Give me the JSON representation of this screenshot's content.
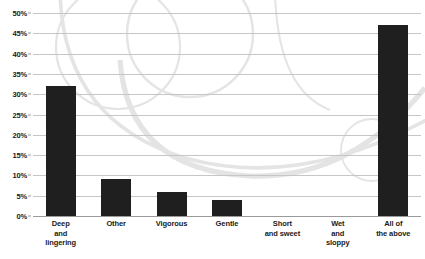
{
  "chart_data": {
    "type": "bar",
    "title": "",
    "xlabel": "",
    "ylabel": "",
    "ylim": [
      0,
      50
    ],
    "grid": true,
    "legend": false,
    "categories": [
      "Deep\nand\nlingering",
      "Other",
      "Vigorous",
      "Gentle",
      "Short\nand sweet",
      "Wet\nand\nsloppy",
      "All of\nthe above"
    ],
    "values": [
      32,
      9,
      6,
      4,
      0,
      0,
      47
    ],
    "ytick_labels": [
      "50%",
      "45%",
      "40%",
      "35%",
      "30%",
      "25%",
      "20%",
      "15%",
      "10%",
      "5%",
      "0%"
    ],
    "ytick_values": [
      50,
      45,
      40,
      35,
      30,
      25,
      20,
      15,
      10,
      5,
      0
    ]
  },
  "style": {
    "bar_color": "#1f1f1f",
    "gridline_color": "#c6c6c6",
    "baseline_color": "#9a9a9a",
    "text_color": "#1a1a1a",
    "background": "#ffffff",
    "watermark_color": "#e4e4e4"
  }
}
